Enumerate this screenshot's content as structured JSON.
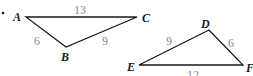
{
  "figure": {
    "bullet": "•",
    "triangles": [
      {
        "name": "ABC",
        "vertices": {
          "A": {
            "label": "A",
            "x": 26,
            "y": 17
          },
          "B": {
            "label": "B",
            "x": 66,
            "y": 47
          },
          "C": {
            "label": "C",
            "x": 137,
            "y": 17
          }
        },
        "sides": {
          "AC": "13",
          "AB": "6",
          "BC": "9"
        }
      },
      {
        "name": "DEF",
        "vertices": {
          "D": {
            "label": "D",
            "x": 209,
            "y": 30
          },
          "E": {
            "label": "E",
            "x": 139,
            "y": 65
          },
          "F": {
            "label": "F",
            "x": 243,
            "y": 65
          }
        },
        "sides": {
          "DE": "9",
          "DF": "6",
          "EF": "12"
        }
      }
    ],
    "colors": {
      "line": "#1a1a1a",
      "vertex_label": "#1a1a1a",
      "side_label": "#8a8a8a"
    }
  }
}
